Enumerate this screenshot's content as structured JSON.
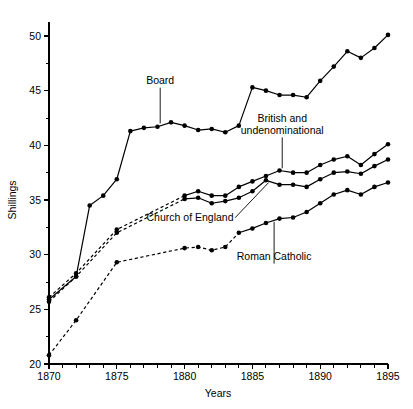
{
  "chart_data": {
    "type": "line",
    "title": "",
    "xlabel": "Years",
    "ylabel": "Shillings",
    "xlim": [
      1870,
      1895
    ],
    "ylim": [
      20,
      52.2
    ],
    "grid": false,
    "legend_position": "inline-annotations",
    "x_major_ticks": [
      1870,
      1875,
      1880,
      1885,
      1890,
      1895
    ],
    "x_major_tick_labels": [
      "1870",
      "1875",
      "1880",
      "1885",
      "1890",
      "1895"
    ],
    "x_minor_tick_step": 1,
    "y_major_ticks": [
      20,
      25,
      30,
      35,
      40,
      45,
      50
    ],
    "y_major_tick_labels": [
      "20",
      "25",
      "30",
      "35",
      "40",
      "45",
      "50"
    ],
    "y_minor_tick_step": 2.5,
    "x": [
      1870,
      1871,
      1872,
      1873,
      1874,
      1875,
      1876,
      1877,
      1878,
      1879,
      1880,
      1881,
      1882,
      1883,
      1884,
      1885,
      1886,
      1887,
      1888,
      1889,
      1890,
      1891,
      1892,
      1893,
      1894,
      1895
    ],
    "series": [
      {
        "name": "Board",
        "style": "solid",
        "marker": "filled-circle",
        "color": "#000000",
        "x": [
          1870,
          1872,
          1873,
          1874,
          1875,
          1876,
          1877,
          1878,
          1879,
          1880,
          1881,
          1882,
          1883,
          1884,
          1885,
          1886,
          1887,
          1888,
          1889,
          1890,
          1891,
          1892,
          1893,
          1894,
          1895
        ],
        "values": [
          25.9,
          28.0,
          34.5,
          35.4,
          36.9,
          41.3,
          41.6,
          41.7,
          42.1,
          41.8,
          41.4,
          41.5,
          41.2,
          41.8,
          45.3,
          45.0,
          44.6,
          44.6,
          44.4,
          45.9,
          47.2,
          48.6,
          48.0,
          48.9,
          50.1
        ]
      },
      {
        "name": "British and undenominational",
        "style": "dashed-then-solid",
        "solid_from": 1880,
        "marker": "filled-circle",
        "color": "#000000",
        "x": [
          1870,
          1872,
          1875,
          1880,
          1881,
          1882,
          1883,
          1884,
          1885,
          1886,
          1887,
          1888,
          1889,
          1890,
          1891,
          1892,
          1893,
          1894,
          1895
        ],
        "values": [
          26.1,
          28.3,
          32.3,
          35.4,
          35.8,
          35.4,
          35.4,
          36.2,
          36.7,
          37.2,
          37.7,
          37.5,
          37.5,
          38.2,
          38.7,
          39.0,
          38.2,
          39.2,
          40.1
        ]
      },
      {
        "name": "Church of England",
        "style": "dashed-then-solid",
        "solid_from": 1880,
        "marker": "filled-circle",
        "color": "#000000",
        "x": [
          1870,
          1872,
          1875,
          1880,
          1881,
          1882,
          1883,
          1884,
          1885,
          1886,
          1887,
          1888,
          1889,
          1890,
          1891,
          1892,
          1893,
          1894,
          1895
        ],
        "values": [
          25.7,
          28.0,
          32.0,
          35.1,
          35.2,
          34.7,
          34.9,
          35.2,
          35.8,
          36.8,
          36.4,
          36.4,
          36.2,
          36.9,
          37.5,
          37.6,
          37.4,
          38.1,
          38.7
        ]
      },
      {
        "name": "Roman Catholic",
        "style": "dashed-then-solid",
        "solid_from": 1884,
        "marker": "filled-circle",
        "color": "#000000",
        "x": [
          1870,
          1872,
          1875,
          1880,
          1881,
          1882,
          1883,
          1884,
          1885,
          1886,
          1887,
          1888,
          1889,
          1890,
          1891,
          1892,
          1893,
          1894,
          1895
        ],
        "values": [
          20.8,
          24.0,
          29.3,
          30.6,
          30.7,
          30.4,
          30.7,
          32.0,
          32.4,
          32.9,
          33.3,
          33.4,
          33.9,
          34.7,
          35.5,
          35.9,
          35.5,
          36.2,
          36.6
        ]
      }
    ],
    "annotations": [
      {
        "text": "Board",
        "lines": [
          "Board"
        ],
        "label_x": 1878.2,
        "label_y": 45.6,
        "leader_to_x": 1878.2,
        "leader_to_y": 42.0
      },
      {
        "text": "British and undenominational",
        "lines": [
          "British and",
          "undenominational"
        ],
        "label_x": 1887.2,
        "label_y": 42.1,
        "leader_to_x": 1887.2,
        "leader_to_y": 37.9
      },
      {
        "text": "Church of England",
        "lines": [
          "Church of England"
        ],
        "label_x": 1880.4,
        "label_y": 33.1,
        "leader_to_x": 1886.2,
        "leader_to_y": 36.6
      },
      {
        "text": "Roman Catholic",
        "lines": [
          "Roman Catholic"
        ],
        "label_x": 1886.6,
        "label_y": 29.5,
        "leader_to_x": 1886.6,
        "leader_to_y": 33.0
      }
    ]
  }
}
